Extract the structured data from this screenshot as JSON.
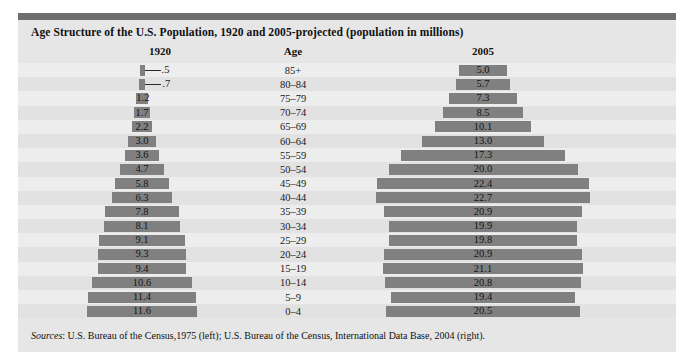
{
  "panel": {
    "title": "Age Structure of the U.S. Population, 1920 and 2005-projected (population in millions)",
    "sources_prefix": "Sources",
    "sources_text": ": U.S. Bureau of the Census,1975 (left); U.S. Bureau of the Census, International Data Base, 2004 (right).",
    "colors": {
      "panel_background": "#e6e6e6",
      "top_bar": "#6e6e6e",
      "bar_fill": "#808080",
      "row_odd": "#ededed",
      "row_even": "#e2e2e2",
      "text": "#1a1a1a"
    }
  },
  "headers": {
    "left": "1920",
    "middle": "Age",
    "right": "2005"
  },
  "chart_data": {
    "type": "bar",
    "title": "Age Structure of the U.S. Population, 1920 and 2005-projected (population in millions)",
    "xlabel": "",
    "ylabel": "Age",
    "grid": false,
    "legend": "none",
    "orientation": "horizontal-population-pyramid",
    "units": "millions",
    "axis_note": "Each side is a centered horizontal bar; bar length is proportional to population in millions.",
    "categories": [
      "85+",
      "80-84",
      "75-79",
      "70-74",
      "65-69",
      "60-64",
      "55-59",
      "50-54",
      "45-49",
      "40-44",
      "35-39",
      "30-34",
      "25-29",
      "20-24",
      "15-19",
      "10-14",
      "5-9",
      "0-4"
    ],
    "series": [
      {
        "name": "1920",
        "values": [
          0.5,
          0.7,
          1.2,
          1.7,
          2.2,
          3.0,
          3.6,
          4.7,
          5.8,
          6.3,
          7.8,
          8.1,
          9.1,
          9.3,
          9.4,
          10.6,
          11.4,
          11.6
        ],
        "labels": [
          ".5",
          ".7",
          "1.2",
          "1.7",
          "2.2",
          "3.0",
          "3.6",
          "4.7",
          "5.8",
          "6.3",
          "7.8",
          "8.1",
          "9.1",
          "9.3",
          "9.4",
          "10.6",
          "11.4",
          "11.6"
        ],
        "label_placement": [
          "outside-leader",
          "outside-leader",
          "inside",
          "inside",
          "inside",
          "inside",
          "inside",
          "inside",
          "inside",
          "inside",
          "inside",
          "inside",
          "inside",
          "inside",
          "inside",
          "inside",
          "inside",
          "inside"
        ]
      },
      {
        "name": "2005",
        "values": [
          5.0,
          5.7,
          7.3,
          8.5,
          10.1,
          13.0,
          17.3,
          20.0,
          22.4,
          22.7,
          20.9,
          19.9,
          19.8,
          20.9,
          21.1,
          20.8,
          19.4,
          20.5
        ],
        "labels": [
          "5.0",
          "5.7",
          "7.3",
          "8.5",
          "10.1",
          "13.0",
          "17.3",
          "20.0",
          "22.4",
          "22.7",
          "20.9",
          "19.9",
          "19.8",
          "20.9",
          "21.1",
          "20.8",
          "19.4",
          "20.5"
        ],
        "label_placement": [
          "inside",
          "inside",
          "inside",
          "inside",
          "inside",
          "inside",
          "inside",
          "inside",
          "inside",
          "inside",
          "inside",
          "inside",
          "inside",
          "inside",
          "inside",
          "inside",
          "inside",
          "inside"
        ]
      }
    ]
  }
}
